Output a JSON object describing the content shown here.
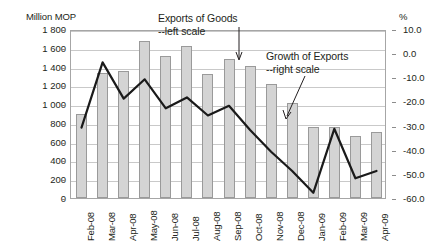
{
  "chart_data": {
    "type": "bar",
    "title": "",
    "unit_left": "Million MOP",
    "unit_right": "%",
    "categories": [
      "Feb-08",
      "Mar-08",
      "Apr-08",
      "May-08",
      "Jun-08",
      "Jul-08",
      "Aug-08",
      "Sep-08",
      "Oct-08",
      "Nov-08",
      "Dec-08",
      "Jan-09",
      "Feb-09",
      "Mar-09",
      "Apr-09"
    ],
    "xlabel": "",
    "ylabel": "Million MOP",
    "y2label": "%",
    "ylim": [
      0,
      1800
    ],
    "y2lim": [
      -60.0,
      10.0
    ],
    "yticks": [
      "0",
      "200",
      "400",
      "600",
      "800",
      "1 000",
      "1 200",
      "1 400",
      "1 600",
      "1 800"
    ],
    "y2ticks": [
      "-60.0",
      "-50.0",
      "-40.0",
      "-30.0",
      "-20.0",
      "-10.0",
      "0.0",
      "10.0"
    ],
    "grid": true,
    "legend_position": "annotations",
    "series": [
      {
        "name": "Exports of Goods",
        "axis": "left",
        "type": "bar",
        "annotation": "Exports of Goods",
        "annotation_sub": "--left scale",
        "values": [
          900,
          1330,
          1350,
          1670,
          1510,
          1615,
          1320,
          1480,
          1410,
          1210,
          1010,
          760,
          760,
          660,
          700
        ]
      },
      {
        "name": "Growth of Exports",
        "axis": "right",
        "type": "line",
        "annotation": "Growth of Exports",
        "annotation_sub": "--right scale",
        "values": [
          -30.0,
          -3.0,
          -18.0,
          -10.0,
          -22.0,
          -17.5,
          -25.0,
          -21.0,
          -31.0,
          -40.0,
          -48.0,
          -57.0,
          -30.5,
          -51.0,
          -48.0
        ]
      }
    ],
    "colors": {
      "bar_fill": "#d4d4d4",
      "bar_border": "#9a9a9a",
      "line": "#1a1a1a",
      "grid": "#c9c9c9",
      "axis": "#a6a6a6",
      "text": "#231f20"
    }
  }
}
